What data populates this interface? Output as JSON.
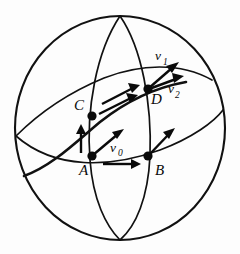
{
  "figure": {
    "background_color": "#fdfdfd",
    "ink_color": "#0a0a0a",
    "width": 240,
    "height": 254
  },
  "sphere": {
    "name": "sphere-outline",
    "center_x": 120,
    "center_y": 128,
    "radius_x": 105,
    "radius_y": 112
  },
  "points": [
    {
      "id": "A",
      "label": "A",
      "x": 92,
      "y": 156,
      "label_x": 84,
      "label_y": 172
    },
    {
      "id": "B",
      "label": "B",
      "x": 148,
      "y": 156,
      "label_x": 155,
      "label_y": 172
    },
    {
      "id": "C",
      "label": "C",
      "x": 92,
      "y": 116,
      "label_x": 78,
      "label_y": 111
    },
    {
      "id": "D",
      "label": "D",
      "x": 148,
      "y": 89,
      "label_x": 152,
      "label_y": 103
    }
  ],
  "vectors": [
    {
      "id": "v0",
      "label_main": "v",
      "label_sub": "0",
      "label_x": 114,
      "label_y": 150,
      "from_x": 93,
      "from_y": 155,
      "to_x": 121,
      "to_y": 132,
      "description": "initial vector at A pointing up-right"
    },
    {
      "id": "vA_up",
      "label_main": "",
      "label_sub": "",
      "from_x": 81,
      "from_y": 152,
      "to_x": 81,
      "to_y": 127,
      "description": "transported vector along AC, vertical at A"
    },
    {
      "id": "vAB",
      "label_main": "",
      "label_sub": "",
      "from_x": 105,
      "from_y": 163,
      "to_x": 138,
      "to_y": 163,
      "description": "horizontal arrow from A toward B"
    },
    {
      "id": "vB",
      "label_main": "",
      "label_sub": "",
      "from_x": 148,
      "from_y": 156,
      "to_x": 172,
      "to_y": 132,
      "description": "vector at B pointing up-right"
    },
    {
      "id": "vCD_upper",
      "label_main": "",
      "label_sub": "",
      "from_x": 103,
      "from_y": 103,
      "to_x": 138,
      "to_y": 86,
      "description": "upper parallel arrow along CD"
    },
    {
      "id": "vCD_lower",
      "label_main": "",
      "label_sub": "",
      "from_x": 100,
      "from_y": 113,
      "to_x": 136,
      "to_y": 96,
      "description": "lower parallel arrow along CD"
    },
    {
      "id": "v1",
      "label_main": "v",
      "label_sub": "1",
      "label_x": 157,
      "label_y": 62,
      "from_x": 148,
      "from_y": 89,
      "to_x": 176,
      "to_y": 64,
      "description": "vector v1 at D pointing up-right steeply"
    },
    {
      "id": "v2",
      "label_main": "v",
      "label_sub": "2",
      "label_x": 172,
      "label_y": 96,
      "from_x": 148,
      "from_y": 89,
      "to_x": 180,
      "to_y": 78,
      "description": "vector v2 at D pointing right, shallower"
    }
  ],
  "curves": [
    {
      "id": "equator",
      "description": "equator great circle seen nearly edge-on"
    },
    {
      "id": "meridian-left",
      "description": "meridian through A and C"
    },
    {
      "id": "meridian-right",
      "description": "meridian through B and D"
    },
    {
      "id": "tilted-circle",
      "description": "tilted great circle through A, C, D"
    }
  ]
}
